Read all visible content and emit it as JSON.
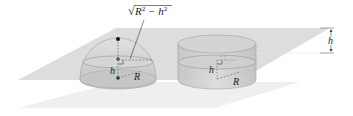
{
  "figure": {
    "labels": {
      "sqrt_label": "√(R² − h²)",
      "sqrt_sym": "√",
      "sqrt_body_R": "R",
      "sqrt_body_exp1": "2",
      "sqrt_body_minus": " − h",
      "sqrt_body_exp2": "2",
      "hemisphere_h": "h",
      "hemisphere_R": "R",
      "cylinder_h": "h",
      "cylinder_R": "R",
      "side_h": "h"
    },
    "colors": {
      "plane_top": "#d9d9d9",
      "plane_bottom": "#efefef",
      "solid_fill": "#c8c8c8",
      "solid_stroke": "#9a9a9a",
      "cross_section": "#bdbdbd",
      "ink": "#222222",
      "dot": "#111111"
    }
  }
}
